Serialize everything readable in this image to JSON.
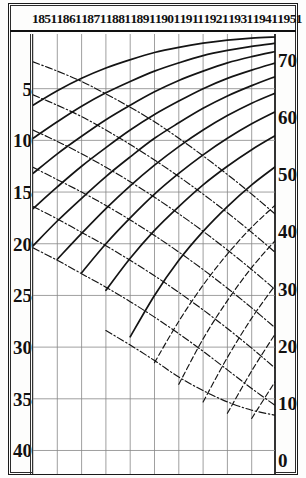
{
  "figure": {
    "title": "",
    "axis_left_label": "",
    "axis_right_label": ""
  },
  "header": {
    "decades": [
      "1851",
      "1861",
      "1871",
      "1881",
      "1891",
      "1901",
      "1911",
      "1921",
      "1931",
      "1941",
      "1951"
    ]
  },
  "axes": {
    "left_ticks": [
      "5",
      "10",
      "15",
      "20",
      "25",
      "30",
      "35",
      "40"
    ],
    "right_ticks": [
      "70",
      "60",
      "50",
      "40",
      "30",
      "20",
      "10",
      "0"
    ]
  },
  "chart_data": {
    "type": "line",
    "title": "",
    "xlabel": "",
    "ylabel": "",
    "x": [
      1851,
      1861,
      1871,
      1881,
      1891,
      1901,
      1911,
      1921,
      1931,
      1941,
      1951
    ],
    "xtick_labels": [
      "1851",
      "1861",
      "1871",
      "1881",
      "1891",
      "1901",
      "1911",
      "1921",
      "1931",
      "1941",
      "1951"
    ],
    "left_axis": {
      "ticks": [
        5,
        10,
        15,
        20,
        25,
        30,
        35,
        40
      ],
      "range": [
        0,
        41.5
      ],
      "direction": "inverted"
    },
    "right_axis": {
      "ticks": [
        70,
        60,
        50,
        40,
        30,
        20,
        10,
        0
      ],
      "range": [
        74,
        -1
      ],
      "direction": "inverted"
    },
    "grid": true,
    "legend": "none",
    "series": [
      {
        "name": "ascending-solid-1",
        "style": "solid",
        "points": [
          [
            1851,
            6.6
          ],
          [
            1861,
            5.2
          ],
          [
            1871,
            4.0
          ],
          [
            1881,
            3.0
          ],
          [
            1891,
            2.2
          ],
          [
            1901,
            1.5
          ],
          [
            1911,
            1.0
          ],
          [
            1921,
            0.6
          ],
          [
            1931,
            0.3
          ],
          [
            1941,
            0.1
          ],
          [
            1951,
            0.0
          ]
        ]
      },
      {
        "name": "ascending-solid-2",
        "style": "solid",
        "points": [
          [
            1851,
            9.8
          ],
          [
            1861,
            8.2
          ],
          [
            1871,
            6.7
          ],
          [
            1881,
            5.4
          ],
          [
            1891,
            4.3
          ],
          [
            1901,
            3.3
          ],
          [
            1911,
            2.5
          ],
          [
            1921,
            1.8
          ],
          [
            1931,
            1.3
          ],
          [
            1941,
            0.9
          ],
          [
            1951,
            0.6
          ]
        ]
      },
      {
        "name": "ascending-solid-3",
        "style": "solid",
        "points": [
          [
            1851,
            13.2
          ],
          [
            1861,
            11.3
          ],
          [
            1871,
            9.6
          ],
          [
            1881,
            8.0
          ],
          [
            1891,
            6.6
          ],
          [
            1901,
            5.3
          ],
          [
            1911,
            4.2
          ],
          [
            1921,
            3.3
          ],
          [
            1931,
            2.5
          ],
          [
            1941,
            1.9
          ],
          [
            1951,
            1.4
          ]
        ]
      },
      {
        "name": "ascending-solid-4",
        "style": "solid",
        "points": [
          [
            1851,
            16.6
          ],
          [
            1861,
            14.5
          ],
          [
            1871,
            12.5
          ],
          [
            1881,
            10.7
          ],
          [
            1891,
            9.0
          ],
          [
            1901,
            7.5
          ],
          [
            1911,
            6.2
          ],
          [
            1921,
            5.0
          ],
          [
            1931,
            4.0
          ],
          [
            1941,
            3.2
          ],
          [
            1951,
            2.5
          ]
        ]
      },
      {
        "name": "ascending-solid-5",
        "style": "solid",
        "points": [
          [
            1851,
            20.2
          ],
          [
            1861,
            17.8
          ],
          [
            1871,
            15.6
          ],
          [
            1881,
            13.5
          ],
          [
            1891,
            11.6
          ],
          [
            1901,
            9.8
          ],
          [
            1911,
            8.3
          ],
          [
            1921,
            6.9
          ],
          [
            1931,
            5.7
          ],
          [
            1941,
            4.7
          ],
          [
            1951,
            3.8
          ]
        ]
      },
      {
        "name": "ascending-solid-6",
        "style": "solid",
        "points": [
          [
            1861,
            21.5
          ],
          [
            1871,
            19.0
          ],
          [
            1881,
            16.6
          ],
          [
            1891,
            14.4
          ],
          [
            1901,
            12.4
          ],
          [
            1911,
            10.6
          ],
          [
            1921,
            9.0
          ],
          [
            1931,
            7.6
          ],
          [
            1941,
            6.4
          ],
          [
            1951,
            5.4
          ]
        ]
      },
      {
        "name": "ascending-solid-7",
        "style": "solid",
        "points": [
          [
            1871,
            22.8
          ],
          [
            1881,
            20.0
          ],
          [
            1891,
            17.5
          ],
          [
            1901,
            15.2
          ],
          [
            1911,
            13.2
          ],
          [
            1921,
            11.4
          ],
          [
            1931,
            9.8
          ],
          [
            1941,
            8.4
          ],
          [
            1951,
            7.2
          ]
        ]
      },
      {
        "name": "ascending-solid-8",
        "style": "solid",
        "points": [
          [
            1881,
            24.5
          ],
          [
            1891,
            21.4
          ],
          [
            1901,
            18.7
          ],
          [
            1911,
            16.4
          ],
          [
            1921,
            14.3
          ],
          [
            1931,
            12.5
          ],
          [
            1941,
            10.9
          ],
          [
            1951,
            9.5
          ]
        ]
      },
      {
        "name": "ascending-solid-9",
        "style": "solid",
        "points": [
          [
            1891,
            29.0
          ],
          [
            1901,
            25.0
          ],
          [
            1911,
            21.6
          ],
          [
            1921,
            18.8
          ],
          [
            1931,
            16.4
          ],
          [
            1941,
            14.3
          ],
          [
            1951,
            12.5
          ]
        ]
      },
      {
        "name": "descending-dashdot-1",
        "style": "dash-dot",
        "points": [
          [
            1851,
            2.4
          ],
          [
            1861,
            3.3
          ],
          [
            1871,
            4.3
          ],
          [
            1881,
            5.5
          ],
          [
            1891,
            6.8
          ],
          [
            1901,
            8.2
          ],
          [
            1911,
            9.8
          ],
          [
            1921,
            11.5
          ],
          [
            1931,
            13.3
          ],
          [
            1941,
            15.2
          ],
          [
            1951,
            17.2
          ]
        ]
      },
      {
        "name": "descending-dashdot-2",
        "style": "dash-dot",
        "points": [
          [
            1851,
            5.6
          ],
          [
            1861,
            6.6
          ],
          [
            1871,
            7.7
          ],
          [
            1881,
            9.0
          ],
          [
            1891,
            10.4
          ],
          [
            1901,
            11.9
          ],
          [
            1911,
            13.5
          ],
          [
            1921,
            15.2
          ],
          [
            1931,
            17.0
          ],
          [
            1941,
            18.9
          ],
          [
            1951,
            20.9
          ]
        ]
      },
      {
        "name": "descending-dashdot-3",
        "style": "dash-dot",
        "points": [
          [
            1851,
            9.0
          ],
          [
            1861,
            10.1
          ],
          [
            1871,
            11.3
          ],
          [
            1881,
            12.6
          ],
          [
            1891,
            14.0
          ],
          [
            1901,
            15.5
          ],
          [
            1911,
            17.1
          ],
          [
            1921,
            18.8
          ],
          [
            1931,
            20.6
          ],
          [
            1941,
            22.5
          ],
          [
            1951,
            24.5
          ]
        ]
      },
      {
        "name": "descending-dashdot-4",
        "style": "dash-dot",
        "points": [
          [
            1851,
            12.6
          ],
          [
            1861,
            13.8
          ],
          [
            1871,
            15.0
          ],
          [
            1881,
            16.3
          ],
          [
            1891,
            17.7
          ],
          [
            1901,
            19.2
          ],
          [
            1911,
            20.8
          ],
          [
            1921,
            22.5
          ],
          [
            1931,
            24.3
          ],
          [
            1941,
            26.2
          ],
          [
            1951,
            28.2
          ]
        ]
      },
      {
        "name": "descending-dashdot-5",
        "style": "dash-dot",
        "points": [
          [
            1851,
            16.4
          ],
          [
            1861,
            17.6
          ],
          [
            1871,
            18.9
          ],
          [
            1881,
            20.2
          ],
          [
            1891,
            21.6
          ],
          [
            1901,
            23.1
          ],
          [
            1911,
            24.7
          ],
          [
            1921,
            26.4
          ],
          [
            1931,
            28.2
          ],
          [
            1941,
            30.1
          ],
          [
            1951,
            32.1
          ]
        ]
      },
      {
        "name": "descending-dashdot-6",
        "style": "dash-dot",
        "points": [
          [
            1851,
            20.4
          ],
          [
            1861,
            21.6
          ],
          [
            1871,
            22.9
          ],
          [
            1881,
            24.2
          ],
          [
            1891,
            25.6
          ],
          [
            1901,
            27.1
          ],
          [
            1911,
            28.7
          ],
          [
            1921,
            30.4
          ],
          [
            1931,
            32.2
          ],
          [
            1941,
            34.0
          ],
          [
            1951,
            35.7
          ]
        ]
      },
      {
        "name": "descending-dashdot-7",
        "style": "dash-dot",
        "points": [
          [
            1881,
            28.4
          ],
          [
            1891,
            29.8
          ],
          [
            1901,
            31.3
          ],
          [
            1911,
            32.9
          ],
          [
            1921,
            34.2
          ],
          [
            1931,
            35.3
          ],
          [
            1941,
            36.1
          ],
          [
            1951,
            36.6
          ]
        ]
      },
      {
        "name": "ascending-dashed-1",
        "style": "dashed",
        "points": [
          [
            1901,
            31.5
          ],
          [
            1911,
            27.5
          ],
          [
            1921,
            24.0
          ],
          [
            1931,
            21.0
          ],
          [
            1941,
            18.4
          ],
          [
            1951,
            16.2
          ]
        ]
      },
      {
        "name": "ascending-dashed-2",
        "style": "dashed",
        "points": [
          [
            1911,
            33.6
          ],
          [
            1921,
            29.2
          ],
          [
            1931,
            25.5
          ],
          [
            1941,
            22.3
          ],
          [
            1951,
            19.6
          ]
        ]
      },
      {
        "name": "ascending-dashed-3",
        "style": "dashed",
        "points": [
          [
            1921,
            35.3
          ],
          [
            1931,
            31.0
          ],
          [
            1941,
            27.2
          ],
          [
            1951,
            23.9
          ]
        ]
      },
      {
        "name": "ascending-dashed-4",
        "style": "dashed",
        "points": [
          [
            1931,
            36.4
          ],
          [
            1941,
            32.3
          ],
          [
            1951,
            28.6
          ]
        ]
      },
      {
        "name": "ascending-dashed-5",
        "style": "dashed",
        "points": [
          [
            1941,
            36.9
          ],
          [
            1951,
            33.2
          ]
        ]
      }
    ]
  }
}
